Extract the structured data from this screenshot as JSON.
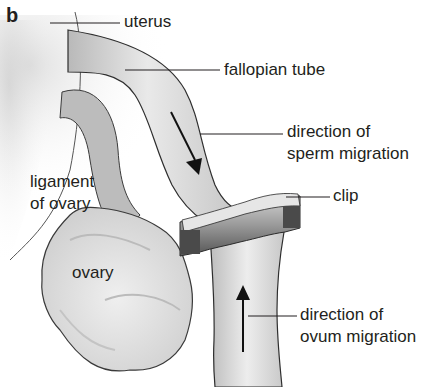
{
  "figure": {
    "panel_label": "b",
    "labels": {
      "uterus": "uterus",
      "fallopian_tube": "fallopian tube",
      "sperm_line1": "direction of",
      "sperm_line2": "sperm migration",
      "clip": "clip",
      "ligament_line1": "ligament",
      "ligament_line2": "of ovary",
      "ovary": "ovary",
      "ovum_line1": "direction of",
      "ovum_line2": "ovum migration"
    },
    "colors": {
      "background": "#ffffff",
      "tissue_light": "#e4e4e4",
      "tissue_mid": "#c8c8c8",
      "tissue_dark": "#a8a8a8",
      "outline": "#3a3a3a",
      "text": "#231f20"
    }
  }
}
